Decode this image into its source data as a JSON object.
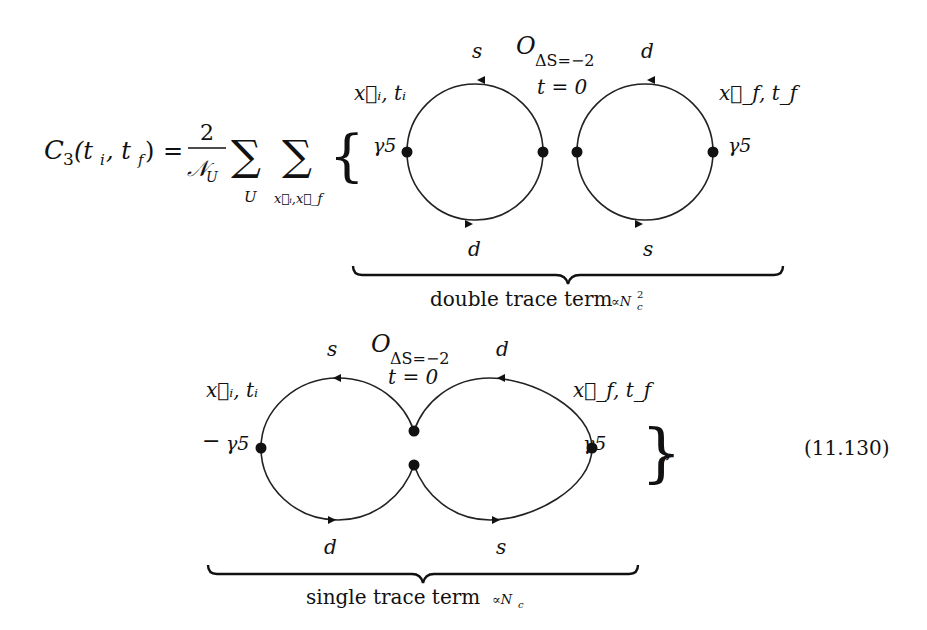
{
  "equation": {
    "lhs": "C₃(tᵢ, t_f)",
    "lhs_parts": {
      "C": "C",
      "sub3": "3",
      "args": "(t",
      "i": "i",
      "comma": ", t",
      "f": "f",
      "close": ")"
    },
    "equals": "=",
    "frac_num": "2",
    "frac_den": "𝒩",
    "frac_den_sub": "U",
    "sum1_symbol": "∑",
    "sum1_sub": "U",
    "sum2_symbol": "∑",
    "sum2_sub": "x⃗ᵢ,x⃗_f",
    "open_brace": "{",
    "close_brace": "}",
    "trailing_comma": ",",
    "minus": "−",
    "number": "(11.130)"
  },
  "double_trace": {
    "op": "O",
    "op_sub": "ΔS=−2",
    "time": "t = 0",
    "src": "x⃗ᵢ, tᵢ",
    "sink": "x⃗_f, t_f",
    "gamma_left": "γ5",
    "gamma_right": "γ5",
    "left_top_quark": "s",
    "left_bottom_quark": "d",
    "right_top_quark": "d",
    "right_bottom_quark": "s",
    "label": "double trace term",
    "label_sub": "∝N",
    "label_sub_c": "c",
    "label_sup": "2"
  },
  "single_trace": {
    "op": "O",
    "op_sub": "ΔS=−2",
    "time": "t = 0",
    "src": "x⃗ᵢ, tᵢ",
    "sink": "x⃗_f, t_f",
    "gamma_left": "γ5",
    "gamma_right": "γ5",
    "left_top_quark": "s",
    "left_bottom_quark": "d",
    "right_top_quark": "d",
    "right_bottom_quark": "s",
    "label": "single trace term",
    "label_sub": "∝N",
    "label_sub_c": "c"
  }
}
